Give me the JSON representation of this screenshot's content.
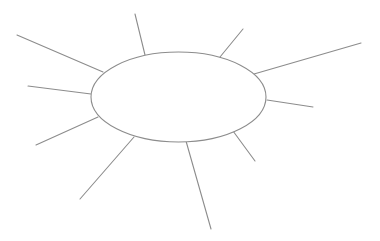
{
  "diagram": {
    "type": "spider-map",
    "background": "#ffffff",
    "stroke_color": "#8c8c8c",
    "stroke_width": 1.1,
    "center": {
      "shape": "ellipse",
      "cx": 178.5,
      "cy": 97,
      "rx": 87.5,
      "ry": 45,
      "label": ""
    },
    "spokes": [
      {
        "id": "spoke-upper-left-long",
        "x1": 17,
        "y1": 35,
        "x2": 103,
        "y2": 72
      },
      {
        "id": "spoke-top-left",
        "x1": 135,
        "y1": 14,
        "x2": 145,
        "y2": 55
      },
      {
        "id": "spoke-top-right",
        "x1": 243,
        "y1": 29,
        "x2": 220,
        "y2": 57
      },
      {
        "id": "spoke-upper-right-long",
        "x1": 361,
        "y1": 43,
        "x2": 254,
        "y2": 74
      },
      {
        "id": "spoke-left",
        "x1": 28,
        "y1": 86,
        "x2": 91,
        "y2": 94
      },
      {
        "id": "spoke-right",
        "x1": 313,
        "y1": 107,
        "x2": 267,
        "y2": 100
      },
      {
        "id": "spoke-lower-left",
        "x1": 36,
        "y1": 145,
        "x2": 98,
        "y2": 117
      },
      {
        "id": "spoke-bottom-left",
        "x1": 80,
        "y1": 199,
        "x2": 134,
        "y2": 137
      },
      {
        "id": "spoke-lower-right",
        "x1": 255,
        "y1": 161,
        "x2": 233,
        "y2": 131
      },
      {
        "id": "spoke-bottom",
        "x1": 211,
        "y1": 229,
        "x2": 186,
        "y2": 141
      }
    ]
  }
}
